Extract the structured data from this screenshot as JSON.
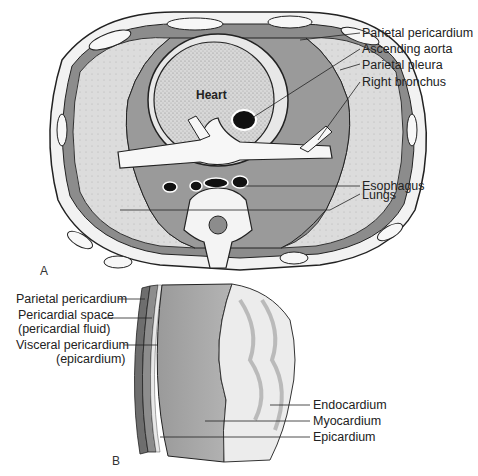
{
  "figure": {
    "panel_a": {
      "letter": "A",
      "inner_label": "Heart",
      "labels": [
        {
          "text": "Parietal pericardium"
        },
        {
          "text": "Ascending aorta"
        },
        {
          "text": "Parietal pleura"
        },
        {
          "text": "Right bronchus"
        },
        {
          "text": "Esophagus"
        },
        {
          "text": "Lungs"
        }
      ]
    },
    "panel_b": {
      "letter": "B",
      "left_labels": [
        {
          "text": "Parietal pericardium"
        },
        {
          "text": "Pericardial space"
        },
        {
          "text": "(pericardial fluid)"
        },
        {
          "text": "Visceral pericardium"
        },
        {
          "text": "(epicardium)"
        }
      ],
      "right_labels": [
        {
          "text": "Endocardium"
        },
        {
          "text": "Myocardium"
        },
        {
          "text": "Epicardium"
        }
      ]
    },
    "colors": {
      "tissue_dark": "#7a7a7a",
      "tissue_mid": "#a9a9a9",
      "tissue_light": "#d9d9d9",
      "outline": "#222222"
    }
  }
}
